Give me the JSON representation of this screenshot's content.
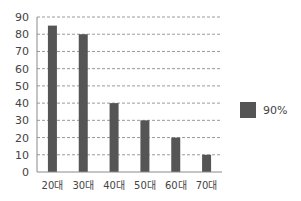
{
  "chart_data": {
    "type": "bar",
    "title": "",
    "xlabel": "",
    "ylabel": "",
    "categories": [
      "20대",
      "30대",
      "40대",
      "50대",
      "60대",
      "70대"
    ],
    "series": [
      {
        "name": "90%",
        "values": [
          85,
          80,
          40,
          30,
          20,
          10
        ],
        "color": "#555555"
      }
    ],
    "ylim": [
      0,
      90
    ],
    "yticks": [
      0,
      10,
      20,
      30,
      40,
      50,
      60,
      70,
      80,
      90
    ],
    "grid": {
      "horizontal": true,
      "style": "dashed",
      "color": "#9a9a9a"
    },
    "legend": {
      "position": "right",
      "entries": [
        "90%"
      ]
    }
  }
}
